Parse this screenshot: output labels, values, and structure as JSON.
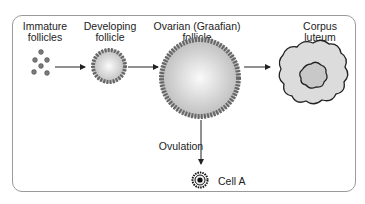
{
  "stages": [
    {
      "label": "Immature\nfollicles"
    },
    {
      "label": "Developing\nfollicle"
    },
    {
      "label": "Ovarian (Graafian)\nfollicle"
    },
    {
      "label": "Corpus\nluteum"
    }
  ],
  "ovulation_label": "Ovulation",
  "cell_label": "Cell A",
  "colors": {
    "frame": "#9a9a9a",
    "ink": "#222222",
    "cell_fill": "#d8d8d8"
  }
}
